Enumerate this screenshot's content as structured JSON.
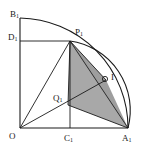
{
  "figure": {
    "kind": "euclidean-geometry-diagram",
    "width": 143,
    "height": 150,
    "background_color": "#ffffff",
    "stroke_color": "#1a1a1a",
    "shade_color": "#a8a8a8",
    "shade_color_dark": "#9a9a9a",
    "labels": {
      "origin": {
        "base": "O",
        "sub": ""
      },
      "a1": {
        "base": "A",
        "sub": "1"
      },
      "b1": {
        "base": "B",
        "sub": "1"
      },
      "c1": {
        "base": "C",
        "sub": "1"
      },
      "d1": {
        "base": "D",
        "sub": "1"
      },
      "p1": {
        "base": "P",
        "sub": "1"
      },
      "q1": {
        "base": "Q",
        "sub": "1"
      },
      "i": {
        "base": "I",
        "sub": ""
      }
    },
    "points": {
      "origin": {
        "x": 20,
        "y": 128
      },
      "a1": {
        "x": 128,
        "y": 128
      },
      "b1": {
        "x": 20,
        "y": 18
      },
      "c1": {
        "x": 70,
        "y": 128
      },
      "d1": {
        "x": 20,
        "y": 41
      },
      "p1": {
        "x": 70,
        "y": 41
      },
      "q1": {
        "x": 68,
        "y": 105
      },
      "i": {
        "x": 106,
        "y": 80
      }
    },
    "shaded_region": {
      "name": "triangle-p1-q1-a1",
      "vertices": [
        "p1",
        "q1",
        "a1"
      ]
    },
    "arcs": [
      {
        "name": "quarter-circle-b1-a1",
        "from": "b1",
        "to": "a1",
        "radius": 110
      },
      {
        "name": "arc-p1-a1",
        "from": "p1",
        "to": "a1",
        "radius": 68
      }
    ],
    "segments": [
      {
        "name": "axis-y-o-b1",
        "from": "origin",
        "to": "b1"
      },
      {
        "name": "axis-x-o-a1",
        "from": "origin",
        "to": "a1"
      },
      {
        "name": "segment-d1-p1",
        "from": "d1",
        "to": "p1"
      },
      {
        "name": "segment-p1-c1",
        "from": "p1",
        "to": "c1"
      },
      {
        "name": "segment-o-p1",
        "from": "origin",
        "to": "p1"
      },
      {
        "name": "segment-o-i",
        "from": "origin",
        "to": "i"
      },
      {
        "name": "segment-p1-q1",
        "from": "p1",
        "to": "q1"
      },
      {
        "name": "segment-q1-a1",
        "from": "q1",
        "to": "a1"
      },
      {
        "name": "segment-p1-a1",
        "from": "p1",
        "to": "a1"
      },
      {
        "name": "segment-p1-i",
        "from": "p1",
        "to": "i"
      }
    ],
    "markers": [
      {
        "name": "right-angle-marker-at-i",
        "at": "i"
      }
    ]
  }
}
